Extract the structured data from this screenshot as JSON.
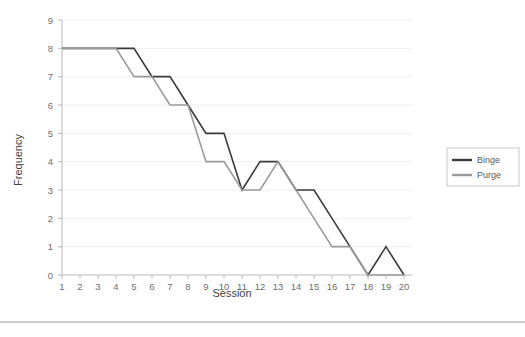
{
  "chart_data": {
    "type": "line",
    "title": "",
    "xlabel": "Session",
    "ylabel": "Frequency",
    "x": [
      1,
      2,
      3,
      4,
      5,
      6,
      7,
      8,
      9,
      10,
      11,
      12,
      13,
      14,
      15,
      16,
      17,
      18,
      19,
      20
    ],
    "xtick_labels": [
      "1",
      "2",
      "3",
      "4",
      "5",
      "6",
      "7",
      "8",
      "9",
      "10",
      "11",
      "12",
      "13",
      "14",
      "15",
      "16",
      "17",
      "18",
      "19",
      "20"
    ],
    "ytick_labels": [
      "0",
      "1",
      "2",
      "3",
      "4",
      "5",
      "6",
      "7",
      "8",
      "9"
    ],
    "ylim": [
      0,
      9
    ],
    "xlim": [
      1,
      20
    ],
    "grid": true,
    "legend_position": "right",
    "series": [
      {
        "name": "Binge",
        "color": "#3b3b3b",
        "values": [
          8,
          8,
          8,
          8,
          8,
          7,
          7,
          6,
          5,
          5,
          3,
          4,
          4,
          3,
          3,
          2,
          1,
          0,
          1,
          0
        ]
      },
      {
        "name": "Purge",
        "color": "#9a9a9a",
        "values": [
          8,
          8,
          8,
          8,
          7,
          7,
          6,
          6,
          4,
          4,
          3,
          3,
          4,
          3,
          2,
          1,
          1,
          0,
          0,
          0
        ]
      }
    ]
  },
  "axes": {
    "x_axis_name": "Session",
    "y_axis_name": "Frequency"
  },
  "legend": {
    "entries": [
      {
        "label": "Binge",
        "color": "#3b3b3b"
      },
      {
        "label": "Purge",
        "color": "#9a9a9a"
      }
    ]
  },
  "colors": {
    "binge": "#3b3b3b",
    "purge": "#9a9a9a",
    "grid": "#f0f0f0",
    "axis": "#b8b8b8",
    "text": "#5a5a5a",
    "background": "#ffffff"
  }
}
